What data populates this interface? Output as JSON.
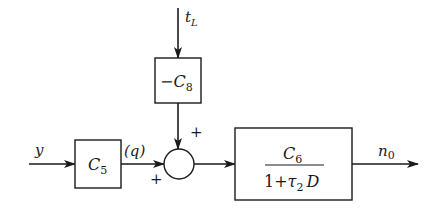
{
  "diagram": {
    "type": "block-diagram",
    "colors": {
      "stroke": "#1a1a1a",
      "background": "#ffffff"
    },
    "signals": {
      "input": "y",
      "disturbance_base": "t",
      "disturbance_sub": "L",
      "intermediate": "(q)",
      "output_base": "n",
      "output_sub": "0"
    },
    "blocks": {
      "c5": {
        "base": "C",
        "sub": "5"
      },
      "c8": {
        "prefix": "−",
        "base": "C",
        "sub": "8"
      },
      "c6_tf": {
        "num_base": "C",
        "num_sub": "6",
        "den_prefix": "1+",
        "den_tau": "τ",
        "den_sub": "2",
        "den_D": "D"
      }
    },
    "summing_junction": {
      "sign_top": "+",
      "sign_left": "+"
    }
  }
}
